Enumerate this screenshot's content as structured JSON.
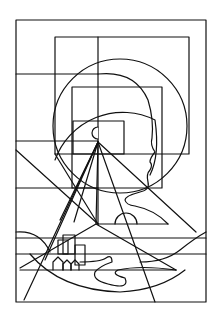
{
  "artwork": {
    "description": "Geometric line drawing: nested rectangles, circles, a head profile in silhouette, rays converging to a point, and a landscape with hills, houses, buildings and a winding river",
    "stroke_color": "#111111",
    "background_color": "#ffffff",
    "elements": [
      "outer-frame",
      "nested-rectangles",
      "large-circle",
      "inner-arc",
      "head-profile",
      "converging-rays",
      "small-box-with-notch",
      "sun-semicircle",
      "hills",
      "buildings",
      "houses",
      "river"
    ]
  }
}
